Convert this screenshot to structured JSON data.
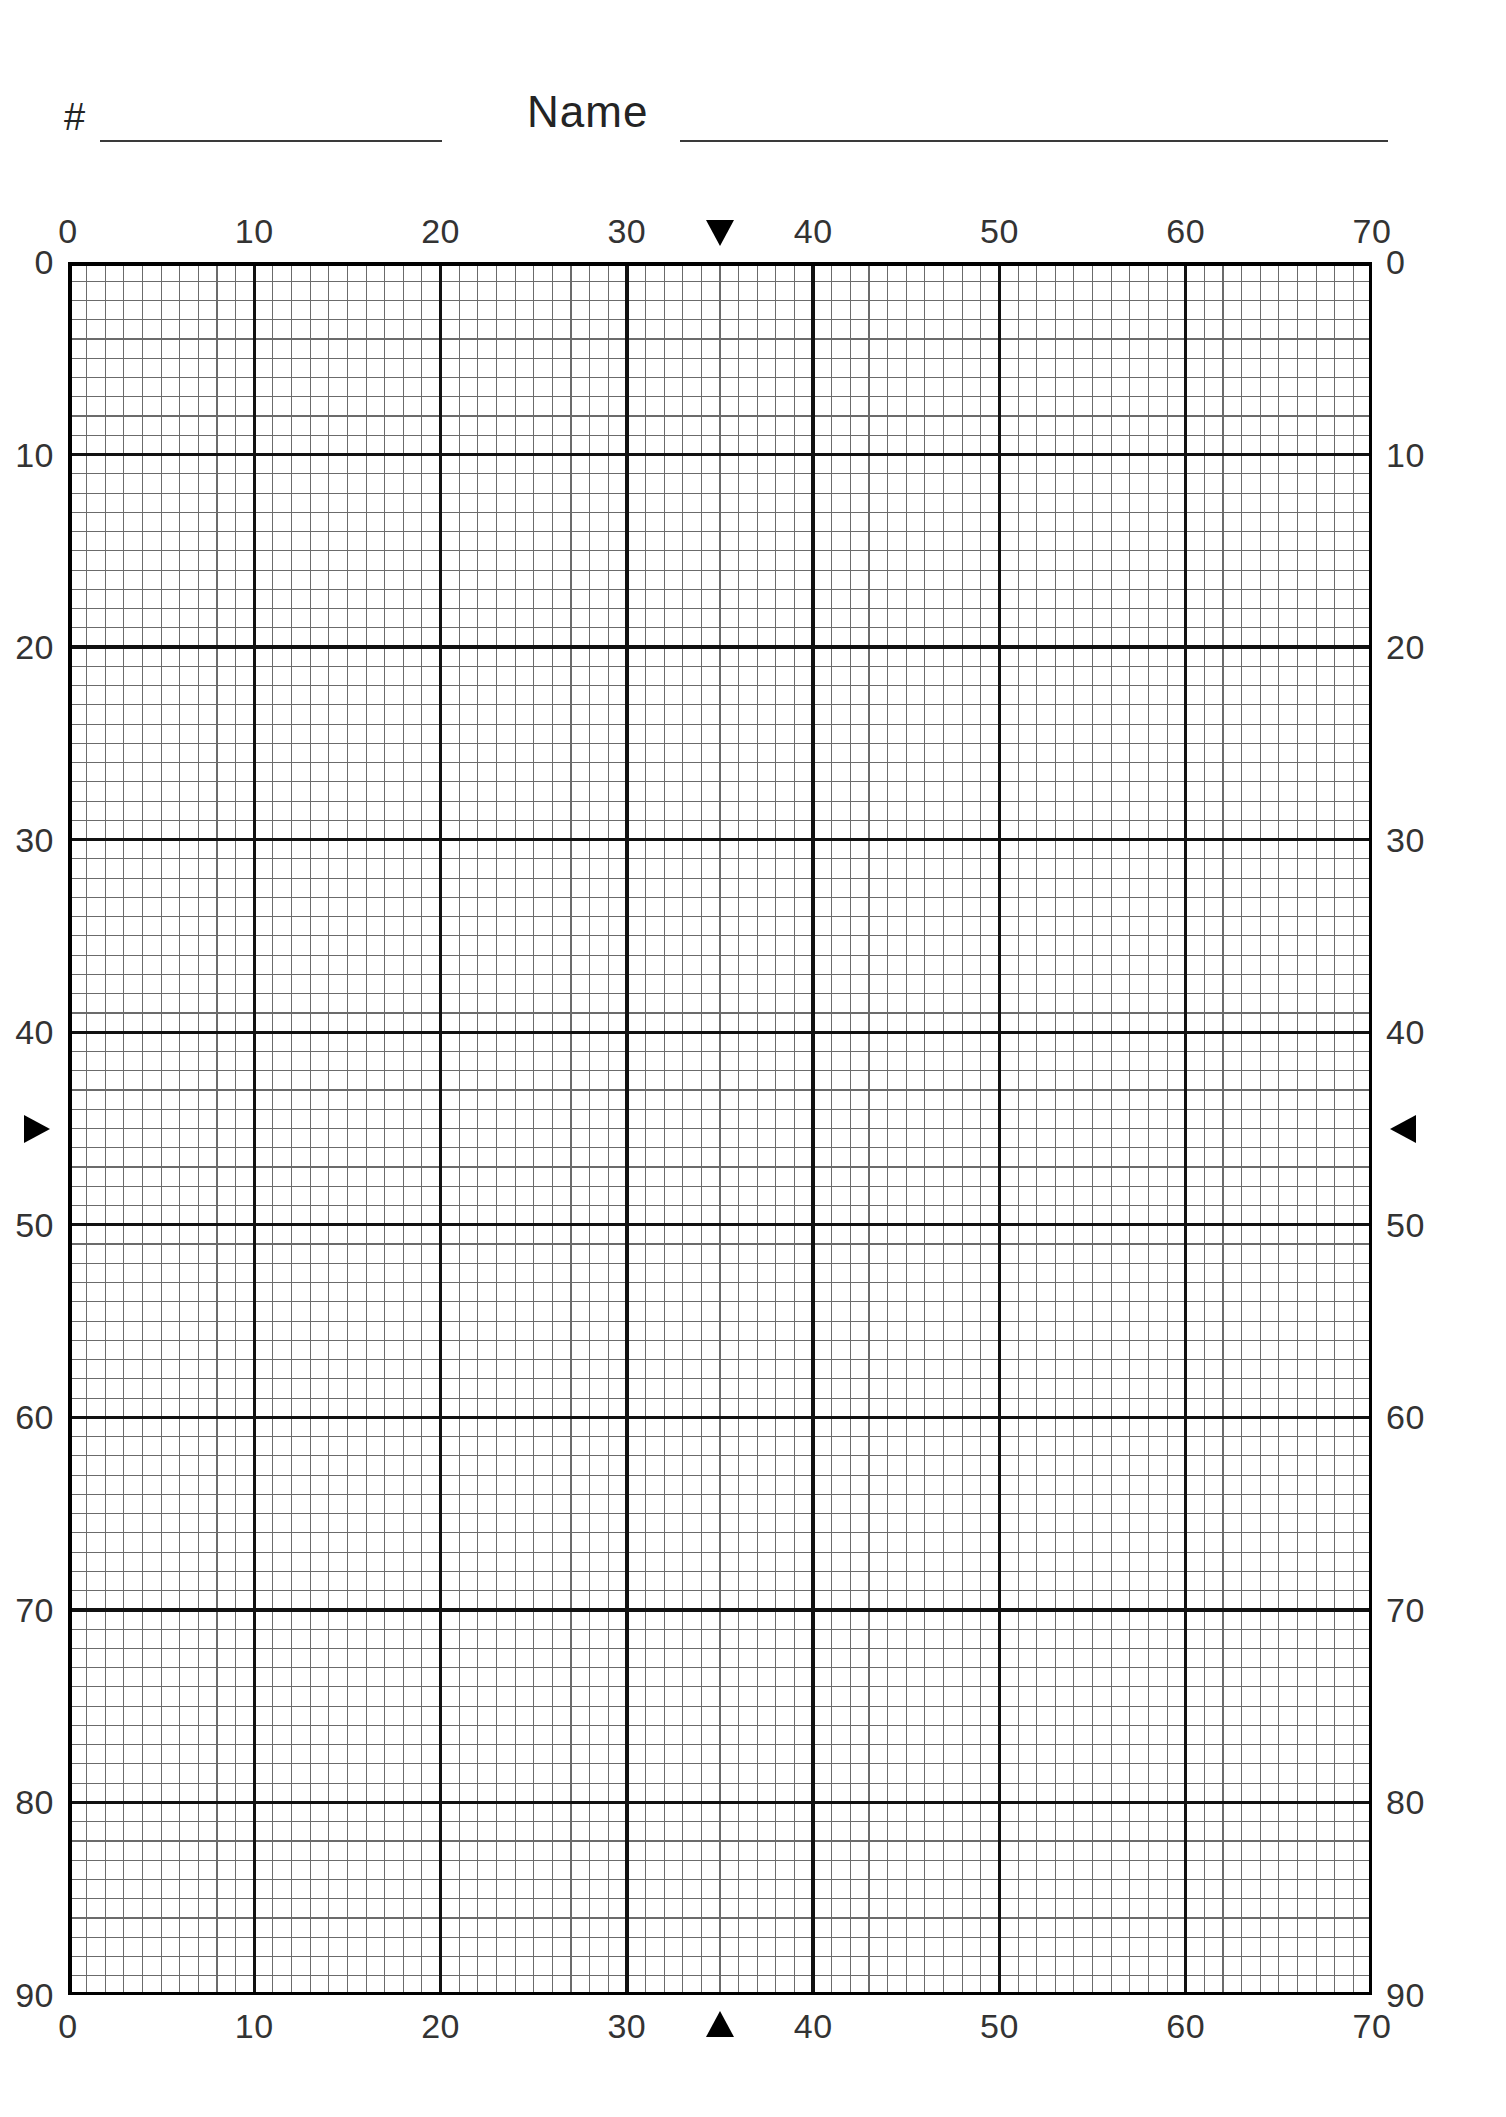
{
  "page": {
    "background_color": "#ffffff",
    "ink_color": "#1a1a1a"
  },
  "header": {
    "number_label": "#",
    "number_value": "",
    "number_placeholder": "",
    "name_label": "Name",
    "name_value": "",
    "name_placeholder": ""
  },
  "chart_data": {
    "type": "table",
    "title": "",
    "subtitle": "",
    "xlabel": "",
    "ylabel": "",
    "grid": true,
    "legend": null,
    "xlim": [
      0,
      70
    ],
    "ylim": [
      0,
      90
    ],
    "x_major_step": 10,
    "y_major_step": 10,
    "x_minor_step": 1,
    "y_minor_step": 1,
    "x_minor_divisions": 70,
    "y_minor_divisions": 90,
    "categories": [],
    "values": [],
    "series": [],
    "axes": {
      "top": {
        "ticks": [
          0,
          10,
          20,
          30,
          40,
          50,
          60,
          70
        ],
        "tick_labels": [
          "0",
          "10",
          "20",
          "30",
          "40",
          "50",
          "60",
          "70"
        ]
      },
      "bottom": {
        "ticks": [
          0,
          10,
          20,
          30,
          40,
          50,
          60,
          70
        ],
        "tick_labels": [
          "0",
          "10",
          "20",
          "30",
          "40",
          "50",
          "60",
          "70"
        ]
      },
      "left": {
        "ticks": [
          0,
          10,
          20,
          30,
          40,
          50,
          60,
          70,
          80,
          90
        ],
        "tick_labels": [
          "0",
          "10",
          "20",
          "30",
          "40",
          "50",
          "60",
          "70",
          "80",
          "90"
        ]
      },
      "right": {
        "ticks": [
          0,
          10,
          20,
          30,
          40,
          50,
          60,
          70,
          80,
          90
        ],
        "tick_labels": [
          "0",
          "10",
          "20",
          "30",
          "40",
          "50",
          "60",
          "70",
          "80",
          "90"
        ]
      }
    },
    "markers": [
      {
        "edge": "top",
        "glyph": "▼",
        "value": 35,
        "name": "top-center-marker"
      },
      {
        "edge": "bottom",
        "glyph": "▲",
        "value": 35,
        "name": "bottom-center-marker"
      },
      {
        "edge": "left",
        "glyph": "▶",
        "value": 45,
        "name": "left-center-marker"
      },
      {
        "edge": "right",
        "glyph": "◀",
        "value": 45,
        "name": "right-center-marker"
      }
    ],
    "colors": {
      "minor_line": "#6b6b6b",
      "major_line": "#111111",
      "border": "#000000",
      "label": "#333333",
      "marker": "#000000"
    }
  }
}
